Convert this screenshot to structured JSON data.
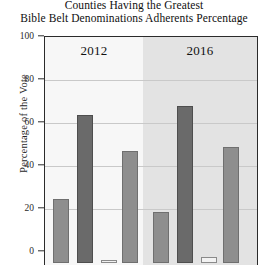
{
  "chart_data": {
    "type": "bar",
    "title": "Counties Having the Greatest Bible Belt Denominations Adherents Percentage",
    "title_line1": "Counties Having the Greatest",
    "title_line2": "Bible Belt Denominations Adherents Percentage",
    "xlabel": "",
    "ylabel": "Percentage of the Vote",
    "ylim": [
      0,
      100
    ],
    "yticks": [
      0,
      20,
      40,
      60,
      80,
      100
    ],
    "ytick_labels": [
      "0",
      "20",
      "40",
      "60",
      "80",
      "100"
    ],
    "grid": true,
    "legend": "none",
    "groups": [
      "2012",
      "2016"
    ],
    "categories": [
      "2012",
      "2016"
    ],
    "series": [
      {
        "name": "bar-1",
        "values": [
          30,
          23.5
        ],
        "color": "#8e8e8e"
      },
      {
        "name": "bar-2",
        "values": [
          69,
          73
        ],
        "color": "#6a6a6a"
      },
      {
        "name": "bar-3",
        "values": [
          1,
          3
        ],
        "color": "#f2f2f2"
      },
      {
        "name": "bar-4",
        "values": [
          52,
          54
        ],
        "color": "#8e8e8e"
      }
    ],
    "bars": [
      {
        "group": "2012",
        "index": 0,
        "value": 30,
        "style": "mid",
        "left": 8,
        "width": 16
      },
      {
        "group": "2012",
        "index": 1,
        "value": 69,
        "style": "dark",
        "left": 32,
        "width": 16
      },
      {
        "group": "2012",
        "index": 2,
        "value": 1,
        "style": "light",
        "left": 56,
        "width": 16
      },
      {
        "group": "2012",
        "index": 3,
        "value": 52,
        "style": "mid",
        "left": 77,
        "width": 16
      },
      {
        "group": "2016",
        "index": 0,
        "value": 23.5,
        "style": "mid",
        "left": 108,
        "width": 16
      },
      {
        "group": "2016",
        "index": 1,
        "value": 73,
        "style": "dark",
        "left": 132,
        "width": 16
      },
      {
        "group": "2016",
        "index": 2,
        "value": 3,
        "style": "light",
        "left": 156,
        "width": 16
      },
      {
        "group": "2016",
        "index": 3,
        "value": 54,
        "style": "mid",
        "left": 178,
        "width": 16
      }
    ]
  },
  "axis": {
    "y_label": "Percentage of the Vote",
    "t100": "100",
    "t80": "80",
    "t60": "60",
    "t40": "40",
    "t20": "20",
    "t0": "0"
  },
  "groups": {
    "g1": "2012",
    "g2": "2016"
  }
}
